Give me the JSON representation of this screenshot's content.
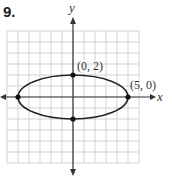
{
  "problem_number": "9.",
  "axes": {
    "x_label": "x",
    "y_label": "y"
  },
  "grid": {
    "x_range": [
      -6,
      6
    ],
    "y_range": [
      -6,
      6
    ],
    "unit": 1
  },
  "ellipse": {
    "center": [
      0,
      0
    ],
    "a": 5,
    "b": 2,
    "equation": "x^2/25 + y^2/4 = 1"
  },
  "points": [
    {
      "label": "(0, 2)",
      "x": 0,
      "y": 2
    },
    {
      "label": "(5, 0)",
      "x": 5,
      "y": 0
    },
    {
      "label": "",
      "x": -5,
      "y": 0
    },
    {
      "label": "",
      "x": 0,
      "y": -2
    }
  ],
  "colors": {
    "curve": "#222222",
    "grid": "#c8c8c8",
    "axis": "#333333"
  }
}
